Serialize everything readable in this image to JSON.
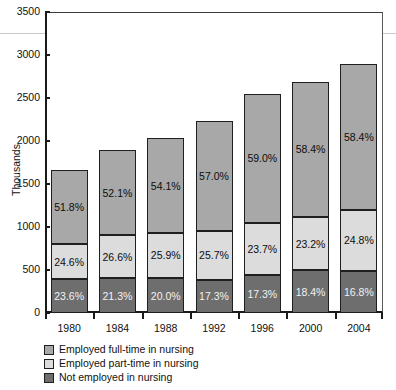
{
  "chart_data": {
    "type": "bar",
    "subtype": "stacked-bar-vertical",
    "title": "",
    "xlabel": "",
    "ylabel": "Thousands",
    "ylim": [
      0,
      3500
    ],
    "ytick_values": [
      0,
      500,
      1000,
      1500,
      2000,
      2500,
      3000,
      3500
    ],
    "ytick_labels": [
      "0",
      "500",
      "1000",
      "1500",
      "2000",
      "2500",
      "3000",
      "3500"
    ],
    "grid": "single faint horizontal line near 3250",
    "legend_position": "below-axes-left",
    "categories": [
      "1980",
      "1984",
      "1988",
      "1992",
      "1996",
      "2000",
      "2004"
    ],
    "totals": [
      1660,
      1890,
      2030,
      2230,
      2550,
      2690,
      2890
    ],
    "series": [
      {
        "name": "Employed full-time in nursing",
        "color": "#a8a8a8",
        "stack_order": "top",
        "percent_labels": [
          "51.8%",
          "52.1%",
          "54.1%",
          "57.0%",
          "59.0%",
          "58.4%",
          "58.4%"
        ],
        "percents": [
          51.8,
          52.1,
          54.1,
          57.0,
          59.0,
          58.4,
          58.4
        ],
        "values": [
          860,
          985,
          1098,
          1271,
          1505,
          1571,
          1688
        ]
      },
      {
        "name": "Employed part-time in nursing",
        "color": "#dcdcdc",
        "stack_order": "middle",
        "percent_labels": [
          "24.6%",
          "26.6%",
          "25.9%",
          "25.7%",
          "23.7%",
          "23.2%",
          "24.8%"
        ],
        "percents": [
          24.6,
          26.6,
          25.9,
          25.7,
          23.7,
          23.2,
          24.8
        ],
        "values": [
          408,
          503,
          526,
          573,
          604,
          624,
          717
        ]
      },
      {
        "name": "Not employed in nursing",
        "color": "#6e6e6e",
        "stack_order": "bottom",
        "percent_labels": [
          "23.6%",
          "21.3%",
          "20.0%",
          "17.3%",
          "17.3%",
          "18.4%",
          "16.8%"
        ],
        "percents": [
          23.6,
          21.3,
          20.0,
          17.3,
          17.3,
          18.4,
          16.8
        ],
        "values": [
          392,
          403,
          406,
          386,
          441,
          495,
          486
        ]
      }
    ]
  },
  "legend": {
    "items": [
      {
        "label": "Employed full-time in nursing",
        "color": "#a8a8a8"
      },
      {
        "label": "Employed part-time in nursing",
        "color": "#dcdcdc"
      },
      {
        "label": "Not employed in nursing",
        "color": "#6e6e6e"
      }
    ]
  }
}
